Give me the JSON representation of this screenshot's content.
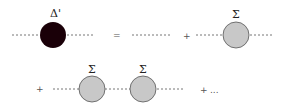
{
  "diagram": {
    "lhs": {
      "label": "Δ'",
      "fill": "#1a0008"
    },
    "equals": "=",
    "terms": [
      {
        "plus": ""
      },
      {
        "plus": "+",
        "label": "Σ"
      },
      {
        "plus": "+",
        "labels": [
          "Σ",
          "Σ"
        ]
      },
      {
        "plus": "+",
        "ellipsis": "..."
      }
    ],
    "self_energy_fill": "#c8c8c8",
    "self_energy_stroke": "#555555"
  }
}
